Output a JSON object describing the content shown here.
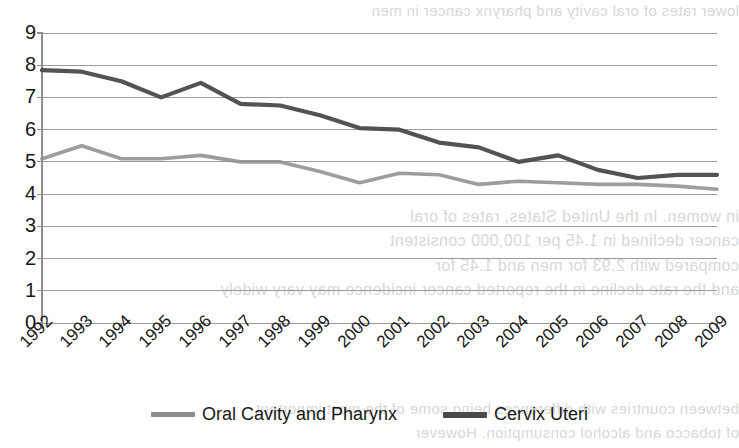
{
  "chart_data": {
    "type": "line",
    "title": "",
    "xlabel": "",
    "ylabel": "",
    "categories": [
      "1992",
      "1993",
      "1994",
      "1995",
      "1996",
      "1997",
      "1998",
      "1999",
      "2000",
      "2001",
      "2002",
      "2003",
      "2004",
      "2005",
      "2006",
      "2007",
      "2008",
      "2009"
    ],
    "ylim": [
      0,
      9
    ],
    "y_ticks": [
      0,
      1,
      2,
      3,
      4,
      5,
      6,
      7,
      8,
      9
    ],
    "grid": "horizontal",
    "legend_position": "bottom",
    "series": [
      {
        "name": "Oral Cavity and Pharynx",
        "color": "#8c8c8c",
        "values": [
          5.1,
          5.5,
          5.1,
          5.1,
          5.2,
          5.0,
          5.0,
          4.7,
          4.35,
          4.65,
          4.6,
          4.3,
          4.4,
          4.35,
          4.3,
          4.3,
          4.25,
          4.15
        ]
      },
      {
        "name": "Cervix Uteri",
        "color": "#4a4a4a",
        "values": [
          7.85,
          7.8,
          7.5,
          7.0,
          7.45,
          6.8,
          6.75,
          6.45,
          6.05,
          6.0,
          5.6,
          5.45,
          5.0,
          5.2,
          4.75,
          4.5,
          4.6,
          4.6
        ]
      }
    ]
  },
  "axes": {
    "y_tick_labels": [
      "9",
      "8",
      "7",
      "6",
      "5",
      "4",
      "3",
      "2",
      "1",
      "0"
    ],
    "x_tick_labels": [
      "1992",
      "1993",
      "1994",
      "1995",
      "1996",
      "1997",
      "1998",
      "1999",
      "2000",
      "2001",
      "2002",
      "2003",
      "2004",
      "2005",
      "2006",
      "2007",
      "2008",
      "2009"
    ]
  },
  "legend": {
    "items": [
      {
        "label": "Oral Cavity and Pharynx",
        "color": "#8c8c8c"
      },
      {
        "label": "Cervix Uteri",
        "color": "#4a4a4a"
      }
    ]
  },
  "background_bleed_text": {
    "line1": "lower rates of oral cavity and pharynx cancer in men",
    "line2": "in women. In the United States, rates of oral",
    "line3": "cancer declined in 1.45 per 100,000 consistent",
    "line4": "compared with 2.93 for men and 1.45 for",
    "line5": "and the rate decline in the reported cancer incidence may vary widely",
    "line6": "between countries with differences being some of the most important",
    "line7": "of tobacco and alcohol consumption. However"
  }
}
